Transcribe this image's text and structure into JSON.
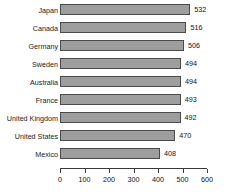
{
  "chart_data": {
    "type": "bar",
    "orientation": "horizontal",
    "title": "",
    "subtitle": "",
    "xlabel": "",
    "ylabel": "",
    "categories": [
      "Japan",
      "Canada",
      "Germany",
      "Sweden",
      "Australia",
      "France",
      "United Kingdom",
      "United States",
      "Mexico"
    ],
    "values": [
      532,
      516,
      506,
      494,
      494,
      493,
      492,
      470,
      408
    ],
    "data_labels": [
      "532",
      "516",
      "506",
      "494",
      "494",
      "493",
      "492",
      "470",
      "408"
    ],
    "xlim": [
      0,
      600
    ],
    "xticks": [
      0,
      100,
      200,
      300,
      400,
      500,
      600
    ],
    "xtick_labels": [
      "0",
      "100",
      "200",
      "300",
      "400",
      "500",
      "600"
    ],
    "grid": false,
    "legend": false,
    "legend_position": "none",
    "bar_color": "#9e9e9e",
    "bar_border_color": "#4a4a4a",
    "background_color": "#ffffff",
    "text_color": "#111111"
  }
}
